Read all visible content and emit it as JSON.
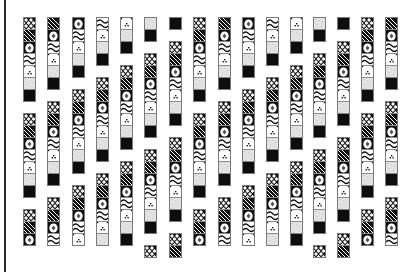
{
  "canvas": {
    "width": 415,
    "height": 272,
    "background": "#ffffff"
  },
  "left_rule": {
    "x": 4,
    "width": 2,
    "color": "#2a2a2a"
  },
  "tile": {
    "size": 12,
    "column_width": 13
  },
  "tile_types": [
    {
      "id": 0,
      "name": "crosshatch",
      "description": "white diamond lattice on black"
    },
    {
      "id": 1,
      "name": "diagonal-stripes",
      "description": "black with white diagonal lines"
    },
    {
      "id": 2,
      "name": "diamond",
      "description": "white circle/diamond on black corners"
    },
    {
      "id": 3,
      "name": "waves",
      "description": "black wavy lines on white"
    },
    {
      "id": 4,
      "name": "dots",
      "description": "small dot cluster on white"
    },
    {
      "id": 5,
      "name": "gray",
      "description": "light gray stipple"
    },
    {
      "id": 6,
      "name": "black",
      "description": "solid black"
    }
  ],
  "columns": [
    {
      "x": 23,
      "segments": [
        {
          "y": 17,
          "start": 0,
          "count": 7
        },
        {
          "y": 113,
          "start": 0,
          "count": 7
        },
        {
          "y": 209,
          "start": 0,
          "count": 3
        }
      ]
    },
    {
      "x": 47,
      "segments": [
        {
          "y": 17,
          "start": 1,
          "count": 6
        },
        {
          "y": 101,
          "start": 0,
          "count": 7
        },
        {
          "y": 197,
          "start": 0,
          "count": 4
        }
      ]
    },
    {
      "x": 72,
      "segments": [
        {
          "y": 17,
          "start": 2,
          "count": 5
        },
        {
          "y": 89,
          "start": 0,
          "count": 7
        },
        {
          "y": 185,
          "start": 0,
          "count": 5
        }
      ]
    },
    {
      "x": 96,
      "segments": [
        {
          "y": 17,
          "start": 3,
          "count": 4
        },
        {
          "y": 77,
          "start": 0,
          "count": 7
        },
        {
          "y": 173,
          "start": 0,
          "count": 6
        }
      ]
    },
    {
      "x": 120,
      "segments": [
        {
          "y": 17,
          "start": 4,
          "count": 3
        },
        {
          "y": 65,
          "start": 0,
          "count": 7
        },
        {
          "y": 161,
          "start": 0,
          "count": 7
        }
      ]
    },
    {
      "x": 144,
      "segments": [
        {
          "y": 17,
          "start": 5,
          "count": 2
        },
        {
          "y": 53,
          "start": 0,
          "count": 7
        },
        {
          "y": 149,
          "start": 0,
          "count": 7
        },
        {
          "y": 245,
          "start": 0,
          "count": 1
        }
      ]
    },
    {
      "x": 169,
      "segments": [
        {
          "y": 17,
          "start": 6,
          "count": 1
        },
        {
          "y": 41,
          "start": 0,
          "count": 7
        },
        {
          "y": 137,
          "start": 0,
          "count": 7
        },
        {
          "y": 233,
          "start": 0,
          "count": 2
        }
      ]
    },
    {
      "x": 193,
      "segments": [
        {
          "y": 17,
          "start": 0,
          "count": 7
        },
        {
          "y": 113,
          "start": 0,
          "count": 7
        },
        {
          "y": 209,
          "start": 0,
          "count": 3
        }
      ]
    },
    {
      "x": 218,
      "segments": [
        {
          "y": 17,
          "start": 1,
          "count": 6
        },
        {
          "y": 101,
          "start": 0,
          "count": 7
        },
        {
          "y": 197,
          "start": 0,
          "count": 4
        }
      ]
    },
    {
      "x": 242,
      "segments": [
        {
          "y": 17,
          "start": 2,
          "count": 5
        },
        {
          "y": 89,
          "start": 0,
          "count": 7
        },
        {
          "y": 185,
          "start": 0,
          "count": 5
        }
      ]
    },
    {
      "x": 266,
      "segments": [
        {
          "y": 17,
          "start": 3,
          "count": 4
        },
        {
          "y": 77,
          "start": 0,
          "count": 7
        },
        {
          "y": 173,
          "start": 0,
          "count": 6
        }
      ]
    },
    {
      "x": 290,
      "segments": [
        {
          "y": 17,
          "start": 4,
          "count": 3
        },
        {
          "y": 65,
          "start": 0,
          "count": 7
        },
        {
          "y": 161,
          "start": 0,
          "count": 7
        }
      ]
    },
    {
      "x": 313,
      "segments": [
        {
          "y": 17,
          "start": 5,
          "count": 2
        },
        {
          "y": 53,
          "start": 0,
          "count": 7
        },
        {
          "y": 149,
          "start": 0,
          "count": 7
        },
        {
          "y": 245,
          "start": 0,
          "count": 1
        }
      ]
    },
    {
      "x": 337,
      "segments": [
        {
          "y": 17,
          "start": 6,
          "count": 1
        },
        {
          "y": 41,
          "start": 0,
          "count": 7
        },
        {
          "y": 137,
          "start": 0,
          "count": 7
        },
        {
          "y": 233,
          "start": 0,
          "count": 2
        }
      ]
    },
    {
      "x": 361,
      "segments": [
        {
          "y": 17,
          "start": 0,
          "count": 7
        },
        {
          "y": 113,
          "start": 0,
          "count": 7
        },
        {
          "y": 209,
          "start": 0,
          "count": 3
        }
      ]
    },
    {
      "x": 385,
      "segments": [
        {
          "y": 17,
          "start": 1,
          "count": 6
        },
        {
          "y": 101,
          "start": 0,
          "count": 7
        },
        {
          "y": 197,
          "start": 0,
          "count": 4
        }
      ]
    }
  ]
}
